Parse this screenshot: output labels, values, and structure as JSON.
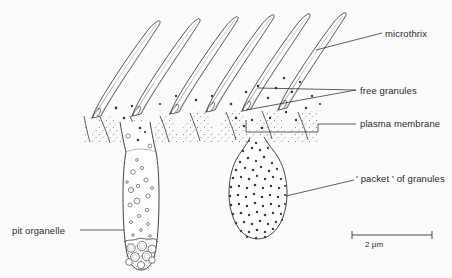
{
  "figure": {
    "type": "scientific-line-drawing",
    "background_color": "#fbfbfb",
    "ink_color": "#3a3a3a"
  },
  "labels": {
    "microthrix": "microthrix",
    "free_granules": "free granules",
    "plasma_membrane": "plasma membrane",
    "packet_of_granules": "' packet ' of granules",
    "pit_organelle": "pit organelle"
  },
  "scale_bar": {
    "text": "2 µm",
    "x_start": 352,
    "x_end": 432,
    "y": 235
  },
  "structures": {
    "microthrices": {
      "count": 6,
      "base_x": [
        88,
        130,
        168,
        204,
        240,
        276
      ],
      "base_y": 113,
      "tip_offset_x": 72,
      "tip_offset_y": -100
    },
    "tegument_band": {
      "top_y": 108,
      "bottom_y": 140,
      "stipple": true
    },
    "pit_organelle": {
      "neck_x": 136,
      "top_y": 120,
      "bulb_bottom_y": 268,
      "width": 30,
      "vesicle_count": 18
    },
    "packet_of_granules": {
      "center_x": 258,
      "center_y": 195,
      "rx": 27,
      "ry": 40,
      "granule_count": 210
    }
  }
}
